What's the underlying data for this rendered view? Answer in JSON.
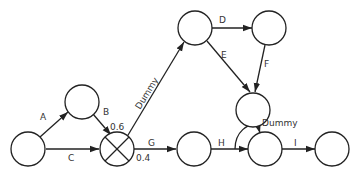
{
  "diagram": {
    "type": "activity-network",
    "nodes": [
      {
        "id": "n1",
        "cx": 28,
        "cy": 149
      },
      {
        "id": "n2",
        "cx": 82,
        "cy": 102
      },
      {
        "id": "n3",
        "cx": 117,
        "cy": 149,
        "crossed": true
      },
      {
        "id": "n4",
        "cx": 194,
        "cy": 149
      },
      {
        "id": "n5",
        "cx": 195,
        "cy": 28
      },
      {
        "id": "n6",
        "cx": 269,
        "cy": 28
      },
      {
        "id": "n7",
        "cx": 253,
        "cy": 110
      },
      {
        "id": "n8",
        "cx": 265,
        "cy": 149
      },
      {
        "id": "n9",
        "cx": 332,
        "cy": 149
      }
    ],
    "edges": [
      {
        "from": "n1",
        "to": "n2",
        "label": "A"
      },
      {
        "from": "n2",
        "to": "n3",
        "label": "B"
      },
      {
        "from": "n1",
        "to": "n3",
        "label": "C"
      },
      {
        "from": "n3",
        "to": "n5",
        "label": "Dummy"
      },
      {
        "from": "n5",
        "to": "n6",
        "label": "D"
      },
      {
        "from": "n5",
        "to": "n7",
        "label": "E"
      },
      {
        "from": "n6",
        "to": "n7",
        "label": "F"
      },
      {
        "from": "n3",
        "to": "n4",
        "label": "G"
      },
      {
        "from": "n4",
        "to": "n8",
        "label": "H"
      },
      {
        "from": "n7",
        "to": "n8",
        "label": "Dummy"
      },
      {
        "from": "n8",
        "to": "n9",
        "label": "I"
      }
    ],
    "labels": {
      "A": "A",
      "B": "B",
      "C": "C",
      "D": "D",
      "E": "E",
      "F": "F",
      "G": "G",
      "H": "H",
      "I": "I",
      "dummy1": "Dummy",
      "dummy2": "Dummy",
      "p_upper": "0.6",
      "p_lower": "0.4"
    }
  }
}
